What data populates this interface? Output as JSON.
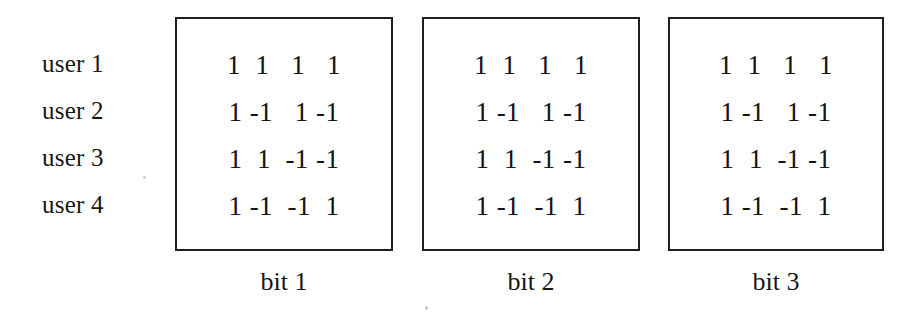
{
  "figure": {
    "kind": "walsh-code-matrix-figure",
    "row_labels": [
      "user 1",
      "user 2",
      "user 3",
      "user 4"
    ],
    "boxes": [
      {
        "caption": "bit 1",
        "rows": [
          "1  1   1   1",
          "1 -1   1 -1",
          "1  1  -1 -1",
          "1 -1  -1  1"
        ]
      },
      {
        "caption": "bit 2",
        "rows": [
          "1  1   1   1",
          "1 -1   1 -1",
          "1  1  -1 -1",
          "1 -1  -1  1"
        ]
      },
      {
        "caption": "bit 3",
        "rows": [
          "1  1   1   1",
          "1 -1   1 -1",
          "1  1  -1 -1",
          "1 -1  -1  1"
        ]
      }
    ],
    "colors": {
      "ink": "#1a1a1a",
      "box_border": "#1f1f1f",
      "background": "#ffffff"
    }
  }
}
